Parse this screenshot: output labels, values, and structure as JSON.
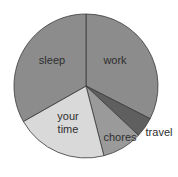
{
  "chart_data": {
    "type": "pie",
    "title": "",
    "start_angle_deg": 0,
    "direction": "clockwise",
    "center": [
      86,
      86
    ],
    "radius": 72,
    "slices": [
      {
        "label": "work",
        "value": 32.5,
        "color": "#8c8c8c",
        "label_pos": [
          115,
          64
        ]
      },
      {
        "label": "travel",
        "value": 4.5,
        "color": "#5f5f5f",
        "label_pos": [
          159,
          136
        ]
      },
      {
        "label": "chores",
        "value": 9.0,
        "color": "#9a9a9a",
        "label_pos": [
          120,
          141
        ]
      },
      {
        "label": "your time",
        "value": 20.8,
        "color": "#d9d9d9",
        "label_pos": [
          68,
          120
        ],
        "label_lines": [
          "your",
          "time"
        ]
      },
      {
        "label": "sleep",
        "value": 33.2,
        "color": "#8c8c8c",
        "label_pos": [
          52,
          64
        ]
      }
    ],
    "stroke": "#3a3a3a",
    "legend": "none"
  }
}
